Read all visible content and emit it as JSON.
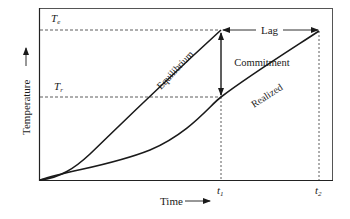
{
  "diagram": {
    "type": "temperature-response-schematic",
    "axes": {
      "x_label": "Time",
      "y_label": "Temperature",
      "x_ticks": [
        {
          "base": "t",
          "sub": "1"
        },
        {
          "base": "t",
          "sub": "2"
        }
      ],
      "y_markers": [
        {
          "base": "T",
          "sub": "e"
        },
        {
          "base": "T",
          "sub": "r"
        }
      ]
    },
    "curves": [
      {
        "name": "Equilibrium",
        "label": "Equilibrium"
      },
      {
        "name": "Realized",
        "label": "Realized"
      }
    ],
    "annotations": {
      "commitment": "Commitment",
      "lag": "Lag"
    },
    "colors": {
      "line": "#1a1a1a",
      "frame": "#555555",
      "background": "#ffffff"
    }
  }
}
